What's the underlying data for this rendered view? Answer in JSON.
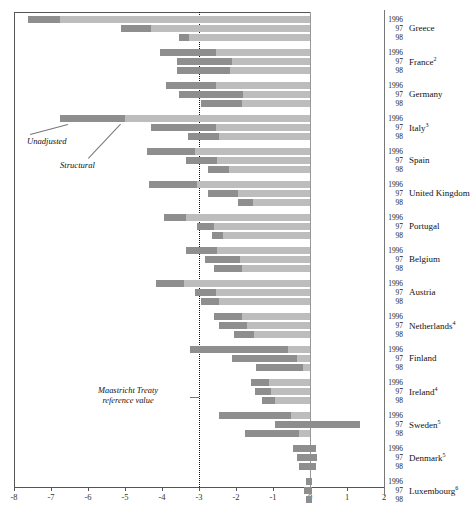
{
  "chart_data": {
    "type": "bar",
    "title": "",
    "xlabel": "",
    "ylabel": "",
    "orientation": "horizontal",
    "xlim": [
      -8,
      2
    ],
    "xticks": [
      -8,
      -7,
      -6,
      -5,
      -4,
      -3,
      -2,
      -1,
      0,
      1,
      2
    ],
    "xticklabels": [
      "-8",
      "-7",
      "-6",
      "-5",
      "-4",
      "-3",
      "-2",
      "-1",
      "0",
      "1",
      "2"
    ],
    "grid": false,
    "legend_position": "inline-annotations",
    "series": [
      {
        "name": "Structural",
        "color": "#8e8e8e"
      },
      {
        "name": "Unadjusted",
        "color": "#bdbdbd"
      }
    ],
    "reference_line": {
      "value": -3,
      "label": "Maastricht Treaty reference value",
      "style": "dotted"
    },
    "years": [
      "1996",
      "97",
      "98"
    ],
    "groups": [
      {
        "country": "Greece",
        "footnote": "",
        "rows": [
          {
            "year": "1996",
            "unadjusted": -7.62,
            "structural": -6.75
          },
          {
            "year": "97",
            "unadjusted": -5.1,
            "structural": -4.3
          },
          {
            "year": "98",
            "unadjusted": -3.55,
            "structural": -3.28
          }
        ]
      },
      {
        "country": "France",
        "footnote": "2",
        "rows": [
          {
            "year": "1996",
            "unadjusted": -4.05,
            "structural": -2.55
          },
          {
            "year": "97",
            "unadjusted": -3.6,
            "structural": -2.1
          },
          {
            "year": "98",
            "unadjusted": -3.6,
            "structural": -2.15
          }
        ]
      },
      {
        "country": "Germany",
        "footnote": "",
        "rows": [
          {
            "year": "1996",
            "unadjusted": -3.9,
            "structural": -2.55
          },
          {
            "year": "97",
            "unadjusted": -3.55,
            "structural": -1.8
          },
          {
            "year": "98",
            "unadjusted": -2.95,
            "structural": -1.85
          }
        ]
      },
      {
        "country": "Italy",
        "footnote": "3",
        "rows": [
          {
            "year": "1996",
            "unadjusted": -6.75,
            "structural": -5.0
          },
          {
            "year": "97",
            "unadjusted": -4.3,
            "structural": -2.55
          },
          {
            "year": "98",
            "unadjusted": -3.3,
            "structural": -2.45
          }
        ]
      },
      {
        "country": "Spain",
        "footnote": "",
        "rows": [
          {
            "year": "1996",
            "unadjusted": -4.4,
            "structural": -3.1
          },
          {
            "year": "97",
            "unadjusted": -3.35,
            "structural": -2.5
          },
          {
            "year": "98",
            "unadjusted": -2.75,
            "structural": -2.2
          }
        ]
      },
      {
        "country": "United Kingdom",
        "footnote": "",
        "rows": [
          {
            "year": "1996",
            "unadjusted": -4.35,
            "structural": -3.05
          },
          {
            "year": "97",
            "unadjusted": -2.75,
            "structural": -1.95
          },
          {
            "year": "98",
            "unadjusted": -1.95,
            "structural": -1.55
          }
        ]
      },
      {
        "country": "Portugal",
        "footnote": "",
        "rows": [
          {
            "year": "1996",
            "unadjusted": -3.95,
            "structural": -3.35
          },
          {
            "year": "97",
            "unadjusted": -3.05,
            "structural": -2.6
          },
          {
            "year": "98",
            "unadjusted": -2.65,
            "structural": -2.35
          }
        ]
      },
      {
        "country": "Belgium",
        "footnote": "",
        "rows": [
          {
            "year": "1996",
            "unadjusted": -3.35,
            "structural": -2.5
          },
          {
            "year": "97",
            "unadjusted": -2.85,
            "structural": -1.9
          },
          {
            "year": "98",
            "unadjusted": -2.6,
            "structural": -1.85
          }
        ]
      },
      {
        "country": "Austria",
        "footnote": "",
        "rows": [
          {
            "year": "1996",
            "unadjusted": -4.15,
            "structural": -3.4
          },
          {
            "year": "97",
            "unadjusted": -3.1,
            "structural": -2.55
          },
          {
            "year": "98",
            "unadjusted": -2.95,
            "structural": -2.45
          }
        ]
      },
      {
        "country": "Netherlands",
        "footnote": "4",
        "rows": [
          {
            "year": "1996",
            "unadjusted": -2.6,
            "structural": -1.85
          },
          {
            "year": "97",
            "unadjusted": -2.45,
            "structural": -1.7
          },
          {
            "year": "98",
            "unadjusted": -2.05,
            "structural": -1.5
          }
        ]
      },
      {
        "country": "Finland",
        "footnote": "",
        "rows": [
          {
            "year": "1996",
            "unadjusted": -3.25,
            "structural": -0.6
          },
          {
            "year": "97",
            "unadjusted": -2.1,
            "structural": -0.35
          },
          {
            "year": "98",
            "unadjusted": -1.45,
            "structural": -0.2
          }
        ]
      },
      {
        "country": "Ireland",
        "footnote": "4",
        "rows": [
          {
            "year": "1996",
            "unadjusted": -1.6,
            "structural": -1.1
          },
          {
            "year": "97",
            "unadjusted": -1.5,
            "structural": -1.05
          },
          {
            "year": "98",
            "unadjusted": -1.3,
            "structural": -0.95
          }
        ]
      },
      {
        "country": "Sweden",
        "footnote": "5",
        "rows": [
          {
            "year": "1996",
            "unadjusted": -2.45,
            "structural": -0.5
          },
          {
            "year": "97",
            "unadjusted": -0.95,
            "structural": 1.35
          },
          {
            "year": "98",
            "unadjusted": -1.75,
            "structural": -0.3
          }
        ]
      },
      {
        "country": "Denmark",
        "footnote": "5",
        "rows": [
          {
            "year": "1996",
            "unadjusted": -0.45,
            "structural": 0.15
          },
          {
            "year": "97",
            "unadjusted": -0.35,
            "structural": 0.2
          },
          {
            "year": "98",
            "unadjusted": -0.3,
            "structural": 0.15
          }
        ]
      },
      {
        "country": "Luxembourg",
        "footnote": "6",
        "rows": [
          {
            "year": "1996",
            "unadjusted": -0.12,
            "structural": 0.05
          },
          {
            "year": "97",
            "unadjusted": -0.15,
            "structural": 0.05
          },
          {
            "year": "98",
            "unadjusted": -0.12,
            "structural": 0.05
          }
        ]
      },
      {
        "country": "European Union",
        "footnote": "7",
        "subtitle": "(Average)",
        "rows": [
          {
            "year": "1996",
            "unadjusted": -4.25,
            "structural": -3.0
          },
          {
            "year": "97",
            "unadjusted": -3.35,
            "structural": -2.0
          },
          {
            "year": "98",
            "unadjusted": -3.0,
            "structural": -1.9
          }
        ]
      }
    ],
    "annotations": [
      {
        "text": "Unadjusted",
        "kind": "series-callout"
      },
      {
        "text": "Structural",
        "kind": "series-callout"
      },
      {
        "text": "Maastricht Treaty",
        "kind": "refline-callout-line1"
      },
      {
        "text": "reference value",
        "kind": "refline-callout-line2"
      }
    ]
  }
}
